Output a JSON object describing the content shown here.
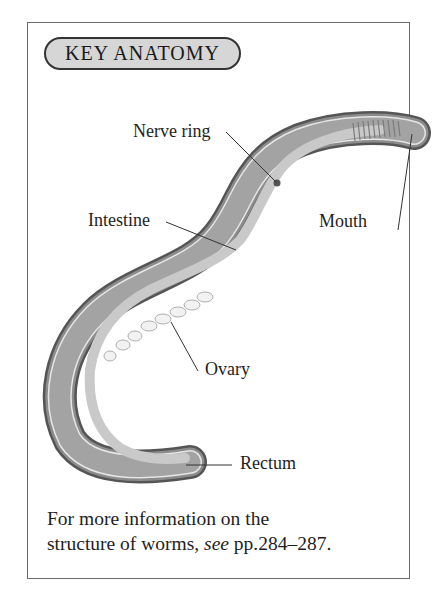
{
  "header": {
    "title": "KEY ANATOMY"
  },
  "labels": {
    "nerve_ring": "Nerve ring",
    "intestine": "Intestine",
    "mouth": "Mouth",
    "ovary": "Ovary",
    "rectum": "Rectum"
  },
  "note": {
    "line1": "For more information on the",
    "line2_prefix": "structure of worms, ",
    "line2_italic": "see",
    "line2_suffix": " pp.284–287."
  }
}
